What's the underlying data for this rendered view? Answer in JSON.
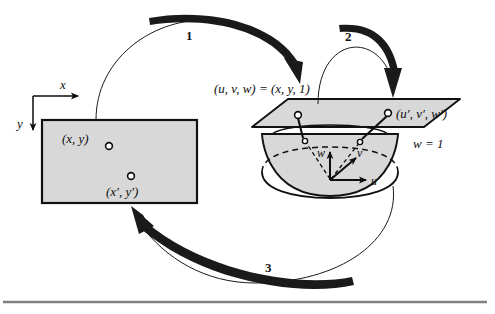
{
  "figure": {
    "name": "homogeneous-coordinates-mapping-diagram",
    "background_color": "#ffffff",
    "fill_gray": "#d8d8d8",
    "stroke_color": "#0d0d0d"
  },
  "image_plane": {
    "name": "image-rectangle",
    "points": [
      {
        "id": "p1",
        "label": "(x, y)",
        "cx": 109,
        "cy": 146
      },
      {
        "id": "p2",
        "label": "(x′, y′)",
        "cx": 131,
        "cy": 176
      }
    ]
  },
  "axes_2d": {
    "x_label": "x",
    "y_label": "y"
  },
  "axes_3d": {
    "u_label": "u",
    "v_label": "v",
    "w_label": "w"
  },
  "projective_plane": {
    "equation_label": "(u, v, w) = (x, y, 1)",
    "plane_level_label": "w = 1",
    "points": [
      {
        "id": "q1",
        "label": "",
        "cx": 298,
        "cy": 115
      },
      {
        "id": "q2",
        "label": "(u′, v′, w′)",
        "cx": 388,
        "cy": 113
      }
    ]
  },
  "arrows": [
    {
      "id": "arrow-1",
      "label": "1"
    },
    {
      "id": "arrow-2",
      "label": "2"
    },
    {
      "id": "arrow-3",
      "label": "3"
    }
  ],
  "rule": {
    "name": "bottom-divider"
  }
}
